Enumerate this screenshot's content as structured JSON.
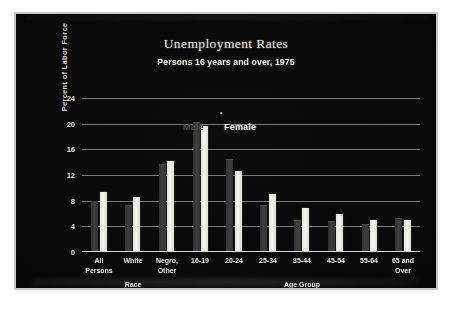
{
  "chart_data": {
    "type": "bar",
    "title": "Unemployment Rates",
    "subtitle": "Persons 16 years and over, 1975",
    "xlabel": "",
    "ylabel": "Percent of Labor Force",
    "ylim": [
      0,
      24
    ],
    "yticks": [
      0,
      4,
      8,
      12,
      16,
      20,
      24
    ],
    "grid": true,
    "legend_position": "inline-above-bars",
    "categories": [
      "All Persons",
      "White",
      "Negro, Other",
      "16-19",
      "20-24",
      "25-34",
      "35-44",
      "45-54",
      "55-64",
      "65 and Over"
    ],
    "category_lines": [
      [
        "All",
        "Persons"
      ],
      [
        "White",
        ""
      ],
      [
        "Negro,",
        "Other"
      ],
      [
        "16-19",
        ""
      ],
      [
        "20-24",
        ""
      ],
      [
        "25-34",
        ""
      ],
      [
        "35-44",
        ""
      ],
      [
        "45-54",
        ""
      ],
      [
        "55-64",
        ""
      ],
      [
        "65 and",
        "Over"
      ]
    ],
    "group_labels": [
      {
        "label": "Race",
        "spans": [
          "All Persons",
          "White",
          "Negro, Other"
        ]
      },
      {
        "label": "Age Group",
        "spans": [
          "16-19",
          "20-24",
          "25-34",
          "35-44",
          "45-54",
          "55-64",
          "65 and Over"
        ]
      }
    ],
    "series": [
      {
        "name": "Male",
        "color": "#3a3a3a",
        "values": [
          7.8,
          7.1,
          13.6,
          20.1,
          14.3,
          7.1,
          4.8,
          4.6,
          4.2,
          5.2
        ]
      },
      {
        "name": "Female",
        "color": "#f0efe9",
        "values": [
          9.4,
          8.6,
          14.2,
          19.7,
          12.7,
          9.1,
          6.9,
          5.9,
          5.0,
          5.0
        ]
      }
    ],
    "annotations": [
      {
        "text": "•",
        "near": "16-19"
      }
    ]
  },
  "legend": {
    "male_label": "Male",
    "female_label": "Female"
  },
  "axis": {
    "y_title": "Percent of Labor Force",
    "tick_0": "0",
    "tick_4": "4",
    "tick_8": "8",
    "tick_12": "12",
    "tick_16": "16",
    "tick_20": "20",
    "tick_24": "24"
  }
}
